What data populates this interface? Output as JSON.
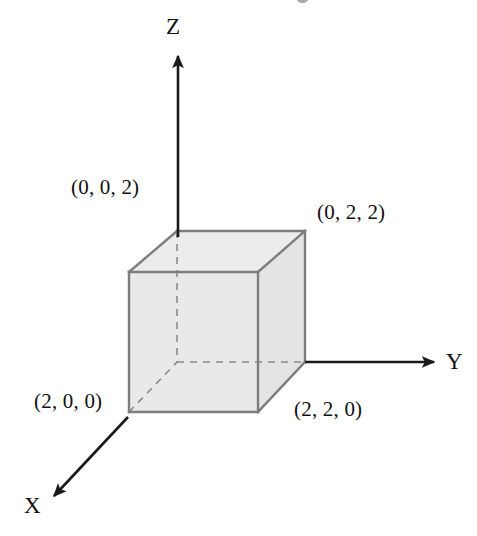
{
  "figure": {
    "kind": "3d-coordinate-axes-with-cube",
    "background_color": "#ffffff",
    "axes": [
      {
        "name": "z-axis",
        "label": "Z",
        "direction": "up"
      },
      {
        "name": "y-axis",
        "label": "Y",
        "direction": "right"
      },
      {
        "name": "x-axis",
        "label": "X",
        "direction": "down-left"
      }
    ],
    "axis_labels": {
      "z": "Z",
      "y": "Y",
      "x": "X"
    },
    "vertex_labels": [
      {
        "name": "vertex-label-002",
        "text": "(0, 0, 2)",
        "coords": [
          0,
          0,
          2
        ]
      },
      {
        "name": "vertex-label-022",
        "text": "(0, 2, 2)",
        "coords": [
          0,
          2,
          2
        ]
      },
      {
        "name": "vertex-label-200",
        "text": "(2, 0, 0)",
        "coords": [
          2,
          0,
          0
        ]
      },
      {
        "name": "vertex-label-220",
        "text": "(2, 2, 0)",
        "coords": [
          2,
          2,
          0
        ]
      }
    ],
    "cube": {
      "name": "unit-cube",
      "side_length": 2,
      "fill_color": "#e9e9e9",
      "edge_color": "#7d7d7d",
      "hidden_edge_style": "dashed"
    },
    "stroke_color": "#1a1a1a"
  }
}
